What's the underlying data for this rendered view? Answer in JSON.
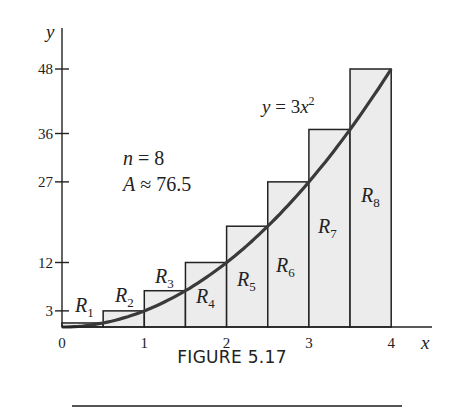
{
  "chart_data": {
    "type": "bar",
    "subtype": "right-endpoint riemann sum with curve",
    "title": "",
    "xlabel": "x",
    "ylabel": "y",
    "xlim": [
      0,
      4
    ],
    "ylim": [
      0,
      48
    ],
    "x_ticks": [
      "0",
      "1",
      "2",
      "3",
      "4"
    ],
    "y_ticks": [
      "3",
      "12",
      "27",
      "36",
      "48"
    ],
    "y_tick_values": [
      3,
      12,
      27,
      36,
      48
    ],
    "grid": false,
    "curve": {
      "label": "y = 3x²",
      "formula": "3x^2"
    },
    "categories": [
      "R1",
      "R2",
      "R3",
      "R4",
      "R5",
      "R6",
      "R7",
      "R8"
    ],
    "x_left": [
      0,
      0.5,
      1,
      1.5,
      2,
      2.5,
      3,
      3.5
    ],
    "x_right": [
      0.5,
      1,
      1.5,
      2,
      2.5,
      3,
      3.5,
      4
    ],
    "values": [
      0.75,
      3,
      6.75,
      12,
      18.75,
      27,
      36.75,
      48
    ],
    "annotations": [
      "n = 8",
      "A ≈ 76.5"
    ]
  },
  "labels": {
    "n": "n = 8",
    "area": "A ≈ 76.5",
    "curve_y": "y",
    "curve_eq": "= 3x",
    "curve_exp": "2",
    "y_axis": "y",
    "x_axis": "x",
    "rects": [
      {
        "main": "R",
        "sub": "1"
      },
      {
        "main": "R",
        "sub": "2"
      },
      {
        "main": "R",
        "sub": "3"
      },
      {
        "main": "R",
        "sub": "4"
      },
      {
        "main": "R",
        "sub": "5"
      },
      {
        "main": "R",
        "sub": "6"
      },
      {
        "main": "R",
        "sub": "7"
      },
      {
        "main": "R",
        "sub": "8"
      }
    ],
    "x_ticks": [
      "0",
      "1",
      "2",
      "3",
      "4"
    ],
    "y_ticks": [
      "3",
      "12",
      "27",
      "36",
      "48"
    ]
  },
  "caption": "FIGURE 5.17"
}
